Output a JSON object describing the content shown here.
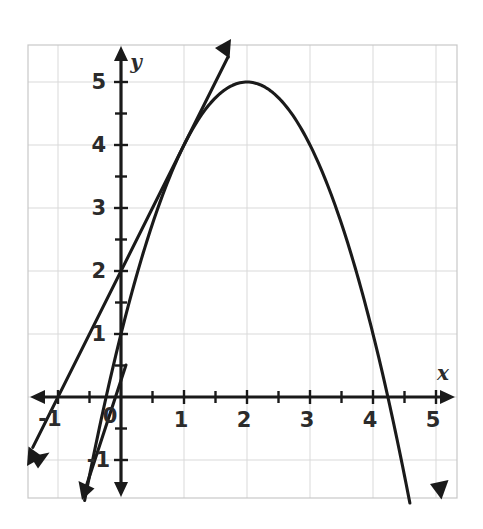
{
  "figure": {
    "name": "coordinate-plane-parabola-with-tangent-line",
    "background_color": "#ffffff",
    "ink_color": "#1a1a1a",
    "grid_color": "#d9d9d9",
    "border_color": "#c8c8c8"
  },
  "axes": {
    "x_axis_name": "x",
    "y_axis_name": "y",
    "origin_label": "0",
    "x_tick_labels": [
      "-1",
      "0",
      "1",
      "2",
      "3",
      "4",
      "5"
    ],
    "x_tick_values": [
      -1,
      0,
      1,
      2,
      3,
      4,
      5
    ],
    "y_tick_labels": [
      "-1",
      "1",
      "2",
      "3",
      "4",
      "5"
    ],
    "y_tick_values": [
      -1,
      1,
      2,
      3,
      4,
      5
    ],
    "minor_tick_step": 0.5,
    "x_range": [
      -1.48,
      5.34
    ],
    "y_range": [
      -1.6,
      5.6
    ],
    "grid": "on",
    "grid_step": 1
  },
  "chart_data": {
    "type": "line",
    "title": "",
    "xlabel": "x",
    "ylabel": "y",
    "xlim": [
      -1.48,
      5.34
    ],
    "ylim": [
      -1.6,
      5.6
    ],
    "grid": true,
    "legend_position": "none",
    "series": [
      {
        "name": "parabola",
        "kind": "quadratic",
        "equation": "y = -x^2 + 4x + 1",
        "vertex": [
          2,
          5
        ],
        "y_intercept": 1,
        "x_intercepts": [
          -0.236,
          4.236
        ],
        "x": [
          -0.75,
          -0.5,
          -0.25,
          0,
          0.25,
          0.5,
          0.75,
          1,
          1.25,
          1.5,
          1.75,
          2,
          2.25,
          2.5,
          2.75,
          3,
          3.25,
          3.5,
          3.75,
          4,
          4.25,
          4.5,
          4.75,
          5
        ],
        "y": [
          -2.5625,
          -1.25,
          -0.0625,
          1,
          1.9375,
          2.75,
          3.4375,
          4,
          4.4375,
          4.75,
          4.9375,
          5,
          4.9375,
          4.75,
          4.4375,
          4,
          3.4375,
          2.75,
          1.9375,
          1,
          -0.0625,
          -1.25,
          -2.5625,
          -4
        ],
        "arrow_ends": [
          "both"
        ]
      },
      {
        "name": "tangent-line",
        "kind": "linear",
        "equation": "y = 2x + 2",
        "y_intercept": 2,
        "slope": 2,
        "x_intercept": -1,
        "tangent_point": [
          1,
          4
        ],
        "x": [
          -1.4,
          1.7
        ],
        "y": [
          -0.8,
          5.4
        ],
        "arrow_ends": [
          "both"
        ]
      }
    ]
  }
}
